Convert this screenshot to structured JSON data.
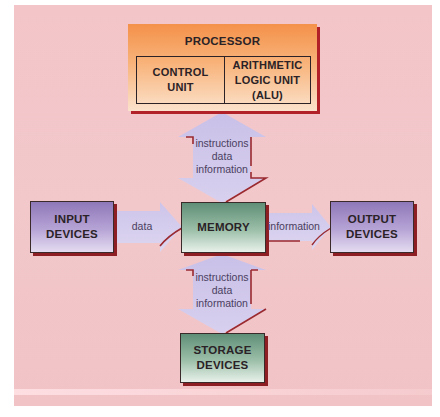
{
  "diagram": {
    "processor": {
      "title": "PROCESSOR",
      "control_unit": [
        "CONTROL",
        "UNIT"
      ],
      "alu": [
        "ARITHMETIC",
        "LOGIC UNIT (ALU)"
      ]
    },
    "input": [
      "INPUT",
      "DEVICES"
    ],
    "memory": "MEMORY",
    "output": [
      "OUTPUT",
      "DEVICES"
    ],
    "storage": [
      "STORAGE",
      "DEVICES"
    ],
    "arrows": {
      "processor_memory": [
        "instructions",
        "data",
        "information"
      ],
      "input_to_memory": "data",
      "memory_to_output": "information",
      "memory_storage": [
        "instructions",
        "data",
        "information"
      ]
    },
    "colors": {
      "background": "#f3c5c9",
      "arrow_fill": "#cfc6ea",
      "shadow": "#8d1f24",
      "processor": "#f4914a",
      "io_boxes": "#8f78b8",
      "memory_storage": "#5f8e76"
    }
  }
}
